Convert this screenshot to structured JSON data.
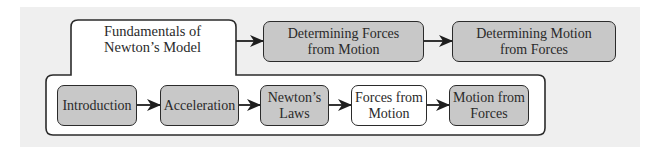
{
  "diagram": {
    "group": {
      "title": "Fundamentals of\nNewton’s Model"
    },
    "top_row": [
      {
        "label": "Determining Forces\nfrom Motion",
        "fill": "#c8c8c8"
      },
      {
        "label": "Determining Motion\nfrom Forces",
        "fill": "#c8c8c8"
      }
    ],
    "inner_row": [
      {
        "label": "Introduction",
        "fill": "#c8c8c8"
      },
      {
        "label": "Acceleration",
        "fill": "#c8c8c8"
      },
      {
        "label": "Newton’s\nLaws",
        "fill": "#c8c8c8"
      },
      {
        "label": "Forces from\nMotion",
        "fill": "#ffffff",
        "highlighted": true
      },
      {
        "label": "Motion from\nForces",
        "fill": "#c8c8c8"
      }
    ],
    "colors": {
      "background_panel": "#efefef",
      "box_gray": "#c8c8c8",
      "box_white": "#ffffff",
      "stroke": "#2b2b2b"
    }
  }
}
